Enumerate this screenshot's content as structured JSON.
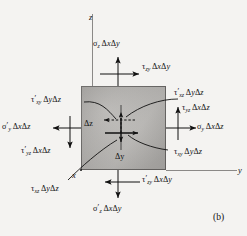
{
  "figure": {
    "caption": "(b)",
    "type": "stress-element-free-body-diagram"
  },
  "axes": {
    "z": "z",
    "y": "y",
    "x": "x"
  },
  "dimensions": {
    "dz": "Δz",
    "dy": "Δy"
  },
  "labels": {
    "top_normal": {
      "symbol": "σ",
      "sub": "z",
      "prime": "",
      "area": "ΔxΔy",
      "full": "σz ΔxΔy"
    },
    "top_shear": {
      "symbol": "τ",
      "sub": "zy",
      "prime": "",
      "area": "ΔxΔy",
      "full": "τzy ΔxΔy"
    },
    "right_upper_shear": {
      "symbol": "τ",
      "sub": "xz",
      "prime": "′",
      "area": "ΔyΔz",
      "full": "τ′xz ΔyΔz"
    },
    "right_shear_yz": {
      "symbol": "τ",
      "sub": "yz",
      "prime": "",
      "area": "ΔxΔz",
      "full": "τyz ΔxΔz"
    },
    "right_normal": {
      "symbol": "σ",
      "sub": "y",
      "prime": "",
      "area": "ΔxΔz",
      "full": "σy ΔxΔz"
    },
    "right_lower_shear": {
      "symbol": "τ",
      "sub": "xy",
      "prime": "",
      "area": "ΔyΔz",
      "full": "τxy ΔyΔz"
    },
    "left_upper_shear": {
      "symbol": "τ",
      "sub": "xy",
      "prime": "′",
      "area": "ΔyΔz",
      "full": "τ′xy ΔyΔz"
    },
    "left_normal": {
      "symbol": "σ",
      "sub": "y",
      "prime": "′",
      "area": "ΔxΔz",
      "full": "σ′y ΔxΔz"
    },
    "left_lower_shear": {
      "symbol": "τ",
      "sub": "yz",
      "prime": "′",
      "area": "ΔxΔz",
      "full": "τ′yz ΔxΔz"
    },
    "bottom_shear": {
      "symbol": "τ",
      "sub": "zy",
      "prime": "′",
      "area": "ΔxΔy",
      "full": "τ′zy ΔxΔy"
    },
    "bottom_left_shear": {
      "symbol": "τ",
      "sub": "xz",
      "prime": "",
      "area": "ΔyΔz",
      "full": "τxz ΔyΔz"
    },
    "bottom_normal": {
      "symbol": "σ",
      "sub": "z",
      "prime": "′",
      "area": "ΔxΔy",
      "full": "σ′z ΔxΔy"
    }
  },
  "colors": {
    "background": "#f4f3f1",
    "cube_fill": "#b8b6b3",
    "cube_edge": "#6e6c6a",
    "ink": "#111111",
    "axis": "#8b8987"
  }
}
